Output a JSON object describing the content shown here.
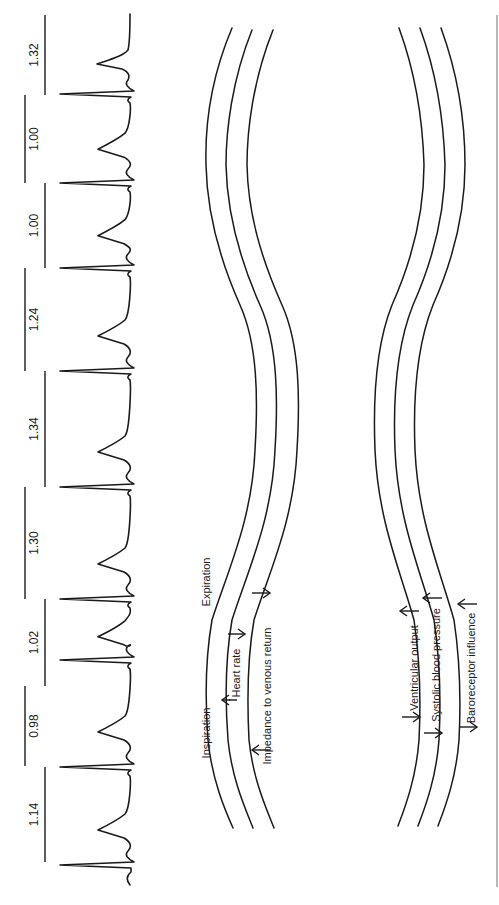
{
  "figure": {
    "colors": {
      "ink": "#1a1a1a",
      "background": "#ffffff",
      "border": "#888888"
    }
  },
  "ecg": {
    "r_peaks_y": [
      865,
      767,
      660,
      599,
      487,
      371,
      268,
      183,
      94
    ],
    "intervals": [
      {
        "label": "1.14",
        "x": 45,
        "y1": 767,
        "y2": 862
      },
      {
        "label": "0.98",
        "x": 25,
        "y1": 686,
        "y2": 766
      },
      {
        "label": "1.02",
        "x": 45,
        "y1": 599,
        "y2": 686
      },
      {
        "label": "1.30",
        "x": 25,
        "y1": 487,
        "y2": 599
      },
      {
        "label": "1.34",
        "x": 45,
        "y1": 371,
        "y2": 487
      },
      {
        "label": "1.24",
        "x": 25,
        "y1": 268,
        "y2": 371
      },
      {
        "label": "1.00",
        "x": 45,
        "y1": 183,
        "y2": 268
      },
      {
        "label": "1.00",
        "x": 25,
        "y1": 95,
        "y2": 183
      },
      {
        "label": "1.32",
        "x": 45,
        "y1": 15,
        "y2": 95
      }
    ]
  },
  "diagram": {
    "phase_labels": {
      "inspiration": "Inspiration",
      "expiration": "Expiration"
    },
    "left_group": {
      "labels": [
        "Heart rate",
        "Impedance to venous return"
      ]
    },
    "right_group": {
      "labels": [
        "Ventricular output",
        "Systolic blood pressure",
        "Baroreceptor influence"
      ]
    }
  }
}
